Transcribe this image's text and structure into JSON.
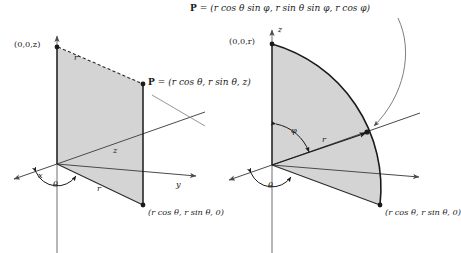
{
  "figure": {
    "title_left": "cylindrical-coordinates-diagram",
    "title_right": "spherical-coordinates-diagram",
    "colors": {
      "shade_fill": "#d4d4d4",
      "stroke": "#4a4a4a",
      "heavy_stroke": "#1a1a1a",
      "text": "#1a1a1a",
      "background": "#ffffff"
    }
  },
  "left_diagram": {
    "name": "cylindrical",
    "point_label": "P",
    "point_equals": "=",
    "point_coords": "(r cos θ, r sin θ, z)",
    "top_vertex_label": "(0,0,z)",
    "base_point_label": "(r cos θ, r sin θ, 0)",
    "axis_x": "x",
    "axis_y": "y",
    "segment_z": "z",
    "radius_top": "r",
    "radius_base": "r",
    "angle_theta": "θ"
  },
  "right_diagram": {
    "name": "spherical",
    "point_label": "P",
    "point_equals": "=",
    "point_coords": "(r cos θ sin φ, r sin θ sin φ, r cos φ)",
    "top_vertex_label": "(0,0,r)",
    "base_point_label": "(r cos θ, r sin θ, 0)",
    "axis_z": "z",
    "radius_label": "r",
    "angle_theta": "θ",
    "angle_phi": "φ"
  }
}
